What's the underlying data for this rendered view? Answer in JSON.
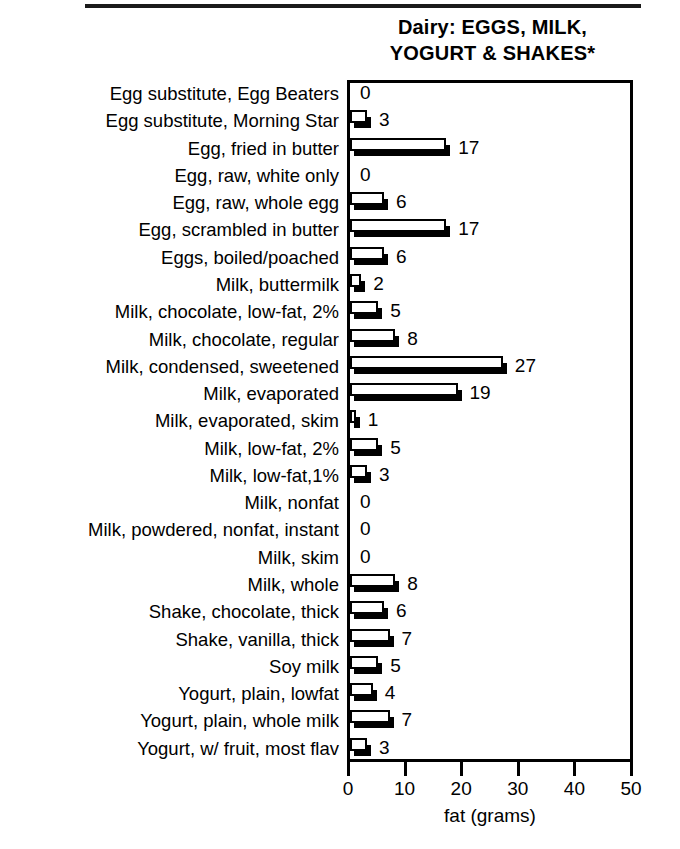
{
  "title": {
    "line1": "Dairy: EGGS, MILK,",
    "line2": "YOGURT & SHAKES*"
  },
  "chart_data": {
    "type": "bar",
    "orientation": "horizontal",
    "title": "Dairy: EGGS, MILK, YOGURT & SHAKES*",
    "xlabel": "fat (grams)",
    "ylabel": "",
    "xlim": [
      0,
      50
    ],
    "xticks": [
      0,
      10,
      20,
      30,
      40,
      50
    ],
    "grid": false,
    "legend": null,
    "categories": [
      "Egg substitute, Egg Beaters",
      "Egg substitute, Morning Star",
      "Egg, fried in butter",
      "Egg, raw, white only",
      "Egg, raw, whole egg",
      "Egg, scrambled in butter",
      "Eggs, boiled/poached",
      "Milk, buttermilk",
      "Milk, chocolate, low-fat, 2%",
      "Milk, chocolate, regular",
      "Milk, condensed, sweetened",
      "Milk, evaporated",
      "Milk, evaporated, skim",
      "Milk, low-fat, 2%",
      "Milk, low-fat,1%",
      "Milk, nonfat",
      "Milk, powdered, nonfat, instant",
      "Milk, skim",
      "Milk, whole",
      "Shake, chocolate, thick",
      "Shake, vanilla, thick",
      "Soy milk",
      "Yogurt, plain, lowfat",
      "Yogurt, plain, whole milk",
      "Yogurt, w/ fruit, most flav"
    ],
    "values": [
      0,
      3,
      17,
      0,
      6,
      17,
      6,
      2,
      5,
      8,
      27,
      19,
      1,
      5,
      3,
      0,
      0,
      0,
      8,
      6,
      7,
      5,
      4,
      7,
      3
    ],
    "value_labels": [
      "0",
      "3",
      "17",
      "0",
      "6",
      "17",
      "6",
      "2",
      "5",
      "8",
      "27",
      "19",
      "1",
      "5",
      "3",
      "0",
      "0",
      "0",
      "8",
      "6",
      "7",
      "5",
      "4",
      "7",
      "3"
    ]
  },
  "axis": {
    "tick_labels": [
      "0",
      "10",
      "20",
      "30",
      "40",
      "50"
    ],
    "title": "fat (grams)"
  },
  "colors": {
    "bar_face": "#ffffff",
    "bar_outline": "#000000",
    "bar_shadow": "#000000",
    "text": "#000000",
    "background": "#ffffff"
  }
}
